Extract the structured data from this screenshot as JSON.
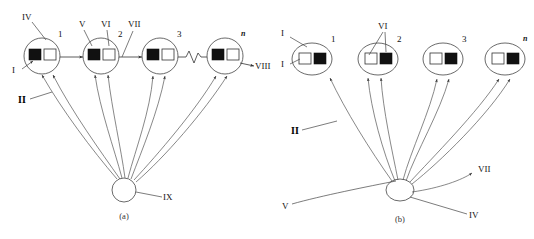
{
  "figure": {
    "panels": [
      {
        "id": "a",
        "caption": "(a)",
        "node_numbers": [
          "1",
          "2",
          "3",
          "n"
        ],
        "node_square_order": "black-left-white-right",
        "top_labels": [
          "IV",
          "V",
          "VI",
          "VII"
        ],
        "left_labels": [
          "I",
          "II"
        ],
        "output_label": "VIII",
        "hub_label": "IX",
        "has_chain_arrows": true,
        "has_squiggle_break": true
      },
      {
        "id": "b",
        "caption": "(b)",
        "node_numbers": [
          "1",
          "2",
          "3",
          "n"
        ],
        "node_square_order": "white-left-black-right",
        "top_labels": [
          "VI"
        ],
        "left_labels": [
          "I",
          "I",
          "II"
        ],
        "hub_labels": [
          "V",
          "IV"
        ],
        "output_label": "VII",
        "has_chain_arrows": false,
        "has_squiggle_break": false
      }
    ],
    "labels": {
      "I": "I",
      "II": "II",
      "IV": "IV",
      "V": "V",
      "VI": "VI",
      "VII": "VII",
      "VIII": "VIII",
      "IX": "IX",
      "n": "n",
      "one": "1",
      "two": "2",
      "three": "3",
      "caption_a": "(a)",
      "caption_b": "(b)"
    },
    "colors": {
      "ink": "#111111",
      "line": "#444444",
      "background": "#ffffff"
    }
  }
}
